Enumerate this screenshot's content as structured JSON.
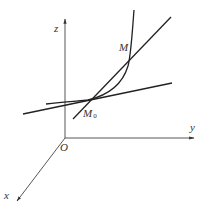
{
  "figure": {
    "type": "3d-coordinate-diagram",
    "colors": {
      "stroke": "#222222",
      "axis": "#444444",
      "label": "#333333",
      "background": "#ffffff"
    },
    "axes": {
      "origin_label": "O",
      "x_label": "x",
      "y_label": "y",
      "z_label": "z"
    },
    "points": {
      "M0": {
        "label": "M",
        "subscript": "0"
      },
      "M": {
        "label": "M"
      }
    },
    "elements": [
      "space-curve",
      "secant-line",
      "tangent-line"
    ]
  }
}
